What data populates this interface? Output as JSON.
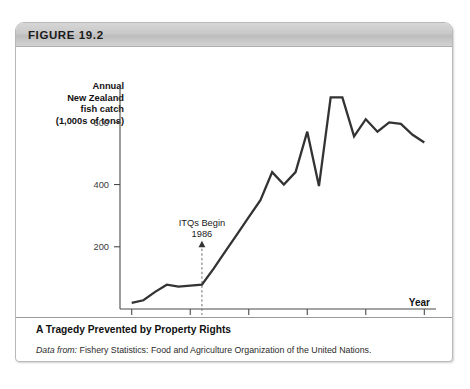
{
  "figure": {
    "header_label": "FIGURE 19.2",
    "caption_title": "A Tragedy Prevented by Property Rights",
    "source_prefix": "Data from:",
    "source_text": "Fishery Statistics: Food and Agriculture Organization of the United Nations."
  },
  "chart_data": {
    "type": "line",
    "title": "",
    "ylabel": "Annual New Zealand fish catch (1,000s of tons)",
    "ylabel_lines": [
      "Annual",
      "New Zealand",
      "fish catch",
      "(1,000s of tons)"
    ],
    "xlabel": "Year",
    "xlim": [
      1979,
      2006
    ],
    "ylim": [
      0,
      720
    ],
    "yticks": [
      200,
      400,
      600
    ],
    "ytick_labels": [
      "200",
      "400",
      "600"
    ],
    "xticks": [
      1980,
      1985,
      1990,
      1995,
      2000,
      2005
    ],
    "xtick_labels": [
      "1980",
      "1985",
      "1990",
      "1995",
      "2000",
      "2005"
    ],
    "grid": false,
    "legend": "none",
    "line_color": "#333333",
    "x": [
      1980,
      1981,
      1982,
      1983,
      1984,
      1985,
      1986,
      1987,
      1988,
      1989,
      1990,
      1991,
      1992,
      1993,
      1994,
      1995,
      1996,
      1997,
      1998,
      1999,
      2000,
      2001,
      2002,
      2003,
      2004,
      2005
    ],
    "values": [
      20,
      28,
      55,
      78,
      72,
      75,
      78,
      130,
      185,
      240,
      295,
      350,
      440,
      400,
      440,
      570,
      395,
      680,
      680,
      555,
      610,
      570,
      600,
      595,
      560,
      535
    ],
    "annotations": [
      {
        "label_line1": "ITQs Begin",
        "label_line2": "1986",
        "x": 1986,
        "y": 78,
        "style": "arrow-up-with-dashed-line"
      }
    ]
  }
}
